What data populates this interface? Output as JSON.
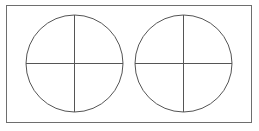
{
  "canvas": {
    "width": 259,
    "height": 131,
    "background_color": "#ffffff"
  },
  "frame": {
    "name": "outer-border-rectangle",
    "x": 6.5,
    "y": 5.5,
    "width": 245,
    "height": 117,
    "stroke_color": "#6e6e6e",
    "stroke_width": 1,
    "fill": "none"
  },
  "shapes": {
    "stroke_color": "#555555",
    "stroke_width": 1,
    "fill": "none",
    "circles": [
      {
        "id": "left",
        "label": "left-circle",
        "cx": 74.5,
        "cy": 63.5,
        "r": 48.5,
        "diameters": [
          {
            "orientation": "horizontal",
            "x1": 26,
            "y1": 63.5,
            "x2": 123,
            "y2": 63.5
          },
          {
            "orientation": "vertical",
            "x1": 74.5,
            "y1": 15,
            "x2": 74.5,
            "y2": 112
          }
        ]
      },
      {
        "id": "right",
        "label": "right-circle",
        "cx": 183.5,
        "cy": 63.5,
        "r": 48.5,
        "diameters": [
          {
            "orientation": "horizontal",
            "x1": 135,
            "y1": 63.5,
            "x2": 232,
            "y2": 63.5
          },
          {
            "orientation": "vertical",
            "x1": 183.5,
            "y1": 15,
            "x2": 183.5,
            "y2": 112
          }
        ]
      }
    ]
  }
}
